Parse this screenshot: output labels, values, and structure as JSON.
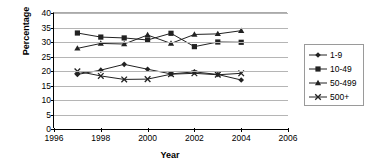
{
  "chart_data": {
    "type": "line",
    "title": "",
    "xlabel": "Year",
    "ylabel": "Percentage",
    "xlim": [
      1996,
      2006
    ],
    "ylim": [
      0,
      40
    ],
    "ytick_step": 5,
    "xtick_step": 2,
    "grid": true,
    "legend_position": "right",
    "xticks": [
      "1996",
      "1998",
      "2000",
      "2002",
      "2004",
      "2006"
    ],
    "yticks": [
      "0",
      "5",
      "10",
      "15",
      "20",
      "25",
      "30",
      "35",
      "40"
    ],
    "x": [
      1997,
      1998,
      1999,
      2000,
      2001,
      2002,
      2003,
      2004
    ],
    "series": [
      {
        "name": "1-9",
        "marker": "diamond",
        "color": "#222222",
        "values": [
          18.8,
          20.3,
          22.3,
          20.6,
          19.0,
          19.7,
          18.8,
          16.9
        ]
      },
      {
        "name": "10-49",
        "marker": "square",
        "color": "#222222",
        "values": [
          33.1,
          31.7,
          31.4,
          30.7,
          33.0,
          28.4,
          30.0,
          29.9
        ]
      },
      {
        "name": "50-499",
        "marker": "triangle",
        "color": "#222222",
        "values": [
          27.8,
          29.5,
          29.3,
          32.4,
          29.5,
          32.6,
          32.8,
          33.9
        ]
      },
      {
        "name": "500+",
        "marker": "x",
        "color": "#222222",
        "values": [
          19.9,
          18.3,
          17.1,
          17.2,
          18.9,
          19.2,
          18.7,
          19.2
        ]
      }
    ]
  },
  "legend": {
    "items": [
      {
        "label": "1-9"
      },
      {
        "label": "10-49"
      },
      {
        "label": "50-499"
      },
      {
        "label": "500+"
      }
    ]
  }
}
